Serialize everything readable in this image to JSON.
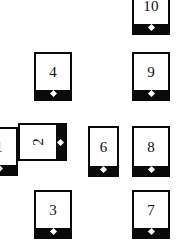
{
  "board": {
    "name": "numbered-card-board",
    "width": 176,
    "height": 246,
    "background": "#ffffff",
    "ink": "#0a0a0a",
    "pip_color": "#ffffff"
  },
  "cards": [
    {
      "id": "card-1",
      "label": "1",
      "x": -20,
      "y": 127,
      "w": 38,
      "h": 49,
      "rotated": false,
      "clipped": "left",
      "z": 1
    },
    {
      "id": "card-2",
      "label": "2",
      "x": 18,
      "y": 123,
      "w": 49,
      "h": 38,
      "rotated": true,
      "clipped": "none",
      "z": 3
    },
    {
      "id": "card-3",
      "label": "3",
      "x": 34,
      "y": 190,
      "w": 38,
      "h": 49,
      "rotated": false,
      "clipped": "bottom",
      "z": 1
    },
    {
      "id": "card-4",
      "label": "4",
      "x": 34,
      "y": 52,
      "w": 38,
      "h": 49,
      "rotated": false,
      "clipped": "none",
      "z": 1
    },
    {
      "id": "card-6",
      "label": "6",
      "x": 88,
      "y": 126,
      "w": 31,
      "h": 51,
      "rotated": false,
      "clipped": "none",
      "z": 1
    },
    {
      "id": "card-7",
      "label": "7",
      "x": 132,
      "y": 190,
      "w": 38,
      "h": 49,
      "rotated": false,
      "clipped": "bottom",
      "z": 1
    },
    {
      "id": "card-8",
      "label": "8",
      "x": 132,
      "y": 126,
      "w": 38,
      "h": 51,
      "rotated": false,
      "clipped": "none",
      "z": 1
    },
    {
      "id": "card-9",
      "label": "9",
      "x": 132,
      "y": 52,
      "w": 38,
      "h": 49,
      "rotated": false,
      "clipped": "none",
      "z": 1
    },
    {
      "id": "card-10",
      "label": "10",
      "x": 132,
      "y": -14,
      "w": 38,
      "h": 49,
      "rotated": false,
      "clipped": "top",
      "z": 1
    }
  ]
}
